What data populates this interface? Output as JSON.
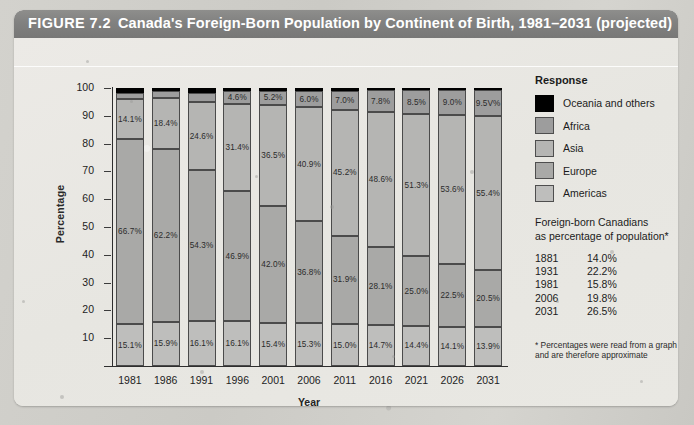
{
  "figure": {
    "number_label": "FIGURE 7.2",
    "title": "Canada's Foreign-Born Population by Continent of Birth, 1981–2031 (projected)"
  },
  "legend": {
    "title": "Response",
    "items": [
      {
        "label": "Oceania and others",
        "color": "#000000"
      },
      {
        "label": "Africa",
        "color": "#9d9d9d"
      },
      {
        "label": "Asia",
        "color": "#b5b5b3"
      },
      {
        "label": "Europe",
        "color": "#a9a9a7"
      },
      {
        "label": "Americas",
        "color": "#bebebc"
      }
    ]
  },
  "stats_panel": {
    "heading_line1": "Foreign-born Canadians",
    "heading_line2": "as percentage of population*",
    "rows": [
      {
        "year": "1881",
        "value": "14.0%"
      },
      {
        "year": "1931",
        "value": "22.2%"
      },
      {
        "year": "1981",
        "value": "15.8%"
      },
      {
        "year": "2006",
        "value": "19.8%"
      },
      {
        "year": "2031",
        "value": "26.5%"
      }
    ],
    "footnote": "* Percentages were read from a graph and are therefore approximate"
  },
  "chart_data": {
    "type": "bar",
    "title": "Canada's Foreign-Born Population by Continent of Birth, 1981–2031 (projected)",
    "xlabel": "Year",
    "ylabel": "Percentage",
    "ylim": [
      0,
      100
    ],
    "yticks": [
      "10",
      "20",
      "30",
      "40",
      "50",
      "60",
      "70",
      "80",
      "90",
      "100"
    ],
    "grid": false,
    "stacked": true,
    "legend_position": "right",
    "categories": [
      "1981",
      "1986",
      "1991",
      "1996",
      "2001",
      "2006",
      "2011",
      "2016",
      "2021",
      "2026",
      "2031"
    ],
    "series": [
      {
        "name": "Americas",
        "color": "#bebebc",
        "values": [
          15.1,
          15.9,
          16.1,
          16.1,
          15.4,
          15.3,
          15.0,
          14.7,
          14.4,
          14.1,
          13.9
        ],
        "labels": [
          "15.1%",
          "15.9%",
          "16.1%",
          "16.1%",
          "15.4%",
          "15.3%",
          "15.0%",
          "14.7%",
          "14.4%",
          "14.1%",
          "13.9%"
        ]
      },
      {
        "name": "Europe",
        "color": "#a9a9a7",
        "values": [
          66.7,
          62.2,
          54.3,
          46.9,
          42.0,
          36.8,
          31.9,
          28.1,
          25.0,
          22.5,
          20.5
        ],
        "labels": [
          "66.7%",
          "62.2%",
          "54.3%",
          "46.9%",
          "42.0%",
          "36.8%",
          "31.9%",
          "28.1%",
          "25.0%",
          "22.5%",
          "20.5%"
        ]
      },
      {
        "name": "Asia",
        "color": "#b5b5b3",
        "values": [
          14.1,
          18.4,
          24.6,
          31.4,
          36.5,
          40.9,
          45.2,
          48.6,
          51.3,
          53.6,
          55.4
        ],
        "labels": [
          "14.1%",
          "18.4%",
          "24.6%",
          "31.4%",
          "36.5%",
          "40.9%",
          "45.2%",
          "48.6%",
          "51.3%",
          "53.6%",
          "55.4%"
        ]
      },
      {
        "name": "Africa",
        "color": "#9d9d9d",
        "values": [
          2.3,
          2.4,
          3.2,
          4.6,
          5.2,
          6.0,
          7.0,
          7.8,
          8.5,
          9.0,
          9.5
        ],
        "labels": [
          "",
          "",
          "",
          "4.6%",
          "5.2%",
          "6.0%",
          "7.0%",
          "7.8%",
          "8.5%",
          "9.0%",
          "9.5V%"
        ]
      },
      {
        "name": "Oceania and others",
        "color": "#000000",
        "values": [
          1.8,
          1.1,
          1.8,
          1.0,
          0.9,
          1.0,
          0.9,
          0.8,
          0.8,
          0.8,
          0.7
        ],
        "labels": [
          "",
          "",
          "",
          "",
          "",
          "",
          "",
          "",
          "",
          "",
          ""
        ]
      }
    ]
  }
}
